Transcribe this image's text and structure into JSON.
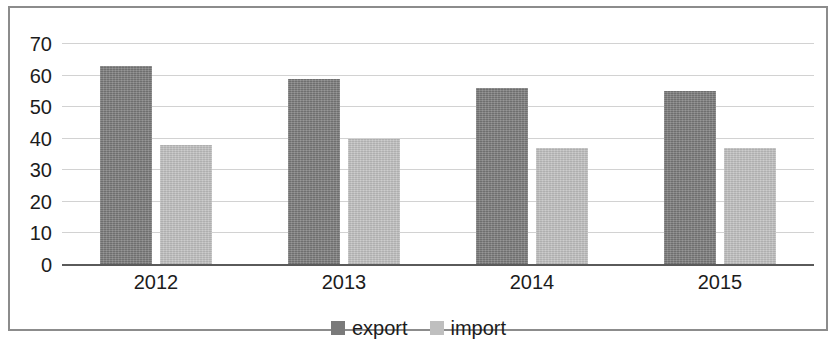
{
  "chart_data": {
    "type": "bar",
    "title": "",
    "subtitle": "",
    "xlabel": "",
    "ylabel": "",
    "categories": [
      "2012",
      "2013",
      "2014",
      "2015"
    ],
    "series": [
      {
        "name": "export",
        "color": "#7a7a7a",
        "values": [
          63,
          59,
          56,
          55
        ]
      },
      {
        "name": "import",
        "color": "#bfbfbf",
        "values": [
          38,
          40,
          37,
          37
        ]
      }
    ],
    "ylim": [
      0,
      70
    ],
    "ytick_labels": [
      "0",
      "10",
      "20",
      "30",
      "40",
      "50",
      "60",
      "70"
    ],
    "ytick_values": [
      0,
      10,
      20,
      30,
      40,
      50,
      60,
      70
    ],
    "grid": true,
    "grid_axis": "y",
    "legend_position": "bottom",
    "legend_entries": [
      "export",
      "import"
    ],
    "plot_background": "#ffffff",
    "gridline_color": "#d2d2d2",
    "axis_color": "#5a5a5a",
    "border_color": "#8c8c8c"
  }
}
